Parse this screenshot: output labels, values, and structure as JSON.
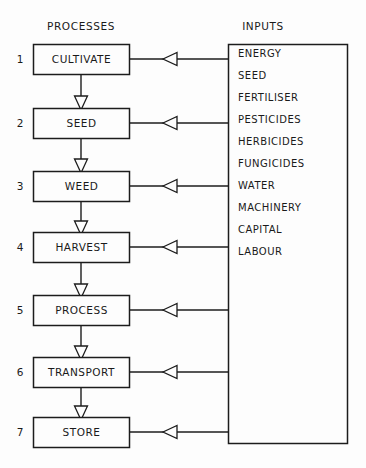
{
  "diagram": {
    "title_processes": "PROCESSES",
    "title_inputs": "INPUTS",
    "processes": [
      {
        "number": "1",
        "label": "CULTIVATE"
      },
      {
        "number": "2",
        "label": "SEED"
      },
      {
        "number": "3",
        "label": "WEED"
      },
      {
        "number": "4",
        "label": "HARVEST"
      },
      {
        "number": "5",
        "label": "PROCESS"
      },
      {
        "number": "6",
        "label": "TRANSPORT"
      },
      {
        "number": "7",
        "label": "STORE"
      }
    ],
    "inputs": [
      "ENERGY",
      "SEED",
      "FERTILISER",
      "PESTICIDES",
      "HERBICIDES",
      "FUNGICIDES",
      "WATER",
      "MACHINERY",
      "CAPITAL",
      "LABOUR"
    ],
    "colors": {
      "line": "#1c1c1c",
      "background": "#fdfdfd",
      "text": "#1a1a1a"
    }
  }
}
